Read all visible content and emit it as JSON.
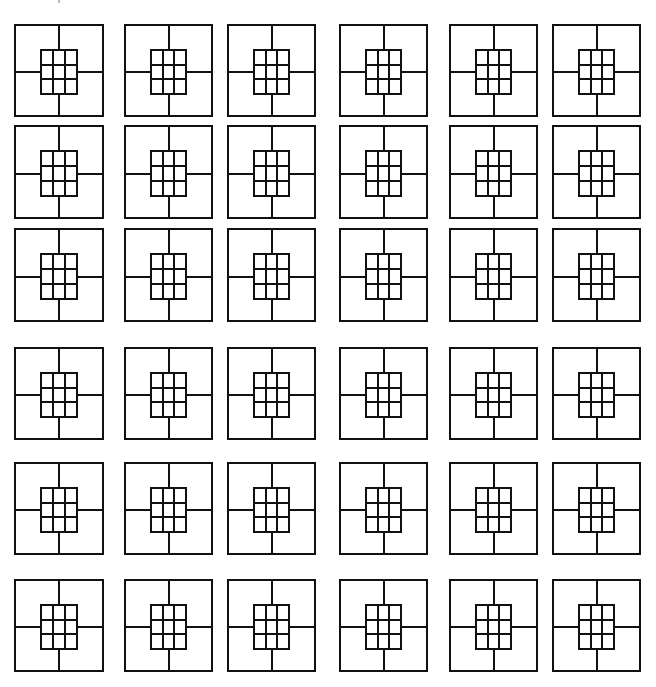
{
  "figure": {
    "stroke_color": "#111111",
    "background": "#ffffff",
    "rows": 6,
    "cols": 6,
    "tile_motif": {
      "outer": "square",
      "inner_grid": [
        3,
        3
      ],
      "inner_box_fraction": [
        0.3,
        0.3,
        0.7,
        0.75
      ],
      "connectors": [
        "top",
        "right",
        "bottom",
        "left"
      ]
    },
    "row_y": [
      [
        24,
        117
      ],
      [
        125,
        219
      ],
      [
        228,
        322
      ],
      [
        347,
        440
      ],
      [
        462,
        555
      ],
      [
        579,
        672
      ]
    ],
    "col_x": [
      [
        14,
        104
      ],
      [
        124,
        213
      ],
      [
        227,
        316
      ],
      [
        339,
        428
      ],
      [
        449,
        538
      ],
      [
        552,
        641
      ]
    ]
  }
}
